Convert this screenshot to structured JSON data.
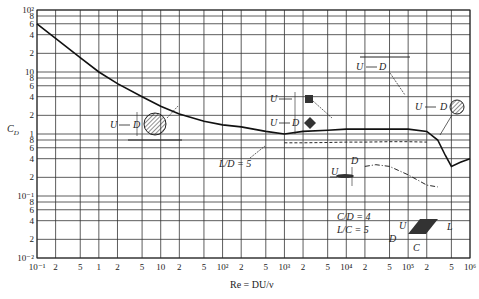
{
  "chart_data": {
    "type": "line",
    "title": "",
    "xlabel": "Re = DU/ν",
    "ylabel": "C_D",
    "xscale": "log",
    "yscale": "log",
    "xlim": [
      0.1,
      1000000
    ],
    "ylim": [
      0.01,
      100
    ],
    "grid": true,
    "x_tick_labels": [
      "10⁻¹",
      "2",
      "5",
      "1",
      "2",
      "5",
      "10",
      "2",
      "5",
      "10²",
      "2",
      "5",
      "10³",
      "2",
      "5",
      "10⁴",
      "2",
      "5",
      "10⁵",
      "2",
      "5",
      "10⁶"
    ],
    "x_tick_values": [
      0.1,
      0.2,
      0.5,
      1,
      2,
      5,
      10,
      20,
      50,
      100,
      200,
      500,
      1000,
      2000,
      5000,
      10000,
      20000,
      50000,
      100000,
      200000,
      500000,
      1000000
    ],
    "y_tick_labels": [
      "10²",
      "8",
      "6",
      "4",
      "2",
      "10",
      "8",
      "6",
      "4",
      "2",
      "1",
      "8",
      "6",
      "4",
      "2",
      "10⁻¹",
      "8",
      "6",
      "4",
      "2",
      "10⁻²"
    ],
    "y_tick_values": [
      100,
      80,
      60,
      40,
      20,
      10,
      8,
      6,
      4,
      2,
      1,
      0.8,
      0.6,
      0.4,
      0.2,
      0.1,
      0.08,
      0.06,
      0.04,
      0.02,
      0.01
    ],
    "series": [
      {
        "name": "Circular cylinder",
        "style": "solid",
        "x": [
          0.1,
          0.2,
          0.5,
          1,
          2,
          5,
          10,
          20,
          50,
          100,
          200,
          500,
          1000,
          2000,
          5000,
          10000,
          20000,
          50000,
          100000,
          200000,
          300000,
          400000,
          500000,
          700000,
          1000000
        ],
        "y": [
          60,
          35,
          17,
          10,
          6.5,
          4,
          2.8,
          2.1,
          1.6,
          1.4,
          1.3,
          1.1,
          1.0,
          1.1,
          1.15,
          1.2,
          1.2,
          1.2,
          1.2,
          1.1,
          0.8,
          0.45,
          0.3,
          0.35,
          0.4
        ]
      },
      {
        "name": "L/D = 5 (dashed)",
        "style": "dashed",
        "x": [
          1000,
          2000,
          5000,
          10000,
          20000,
          50000,
          100000,
          200000
        ],
        "y": [
          0.72,
          0.72,
          0.73,
          0.74,
          0.74,
          0.75,
          0.75,
          0.74
        ]
      },
      {
        "name": "Flat plate (dash-dot)",
        "style": "dashdot",
        "x": [
          20000,
          30000,
          50000,
          100000,
          200000,
          300000
        ],
        "y": [
          0.3,
          0.32,
          0.3,
          0.22,
          0.15,
          0.14
        ]
      }
    ],
    "annotations": [
      {
        "text": "U → D",
        "shape": "circle",
        "note": "circular cylinder"
      },
      {
        "text": "U → D",
        "shape": "square",
        "note": "square cylinder"
      },
      {
        "text": "U → D",
        "shape": "diamond",
        "note": "diamond cylinder"
      },
      {
        "text": "U → D",
        "shape": "circle",
        "note": "cylinder (right)"
      },
      {
        "text": "L/D = 5"
      },
      {
        "text": "U → D",
        "shape": "ellipse",
        "note": "streamlined"
      },
      {
        "text": "C/D = 4"
      },
      {
        "text": "L/C = 5"
      },
      {
        "text": "U D C L",
        "shape": "parallelogram",
        "note": "inclined plate"
      }
    ]
  },
  "labels": {
    "ylabel": "C",
    "ylabel_sub": "D",
    "xlabel": "Re = DU/ν",
    "ld5": "L/D = 5",
    "cd4": "C/D = 4",
    "lc5": "L/C = 5",
    "U": "U",
    "D": "D",
    "C": "C",
    "L": "L"
  }
}
